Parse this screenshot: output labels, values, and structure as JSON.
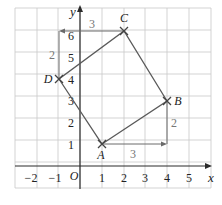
{
  "diagram": {
    "axes": {
      "x_label": "x",
      "y_label": "y",
      "origin_label": "O",
      "x_ticks": [
        "−2",
        "−1",
        "1",
        "2",
        "3",
        "4",
        "5"
      ],
      "y_ticks": [
        "1",
        "2",
        "3",
        "4",
        "5",
        "6"
      ]
    },
    "points": {
      "A": {
        "label": "A",
        "x": 1,
        "y": 1
      },
      "B": {
        "label": "B",
        "x": 4,
        "y": 3
      },
      "C": {
        "label": "C",
        "x": 2,
        "y": 6
      },
      "D": {
        "label": "D",
        "x": -1,
        "y": 4
      }
    },
    "step_labels": {
      "ab_horizontal": "3",
      "ab_vertical": "2",
      "dc_horizontal": "3",
      "dc_vertical": "2"
    },
    "colors": {
      "grid": "#c8c8c8",
      "shape": "#5a5a5a",
      "axis": "#2a2a2a",
      "step_text": "#777777"
    }
  }
}
